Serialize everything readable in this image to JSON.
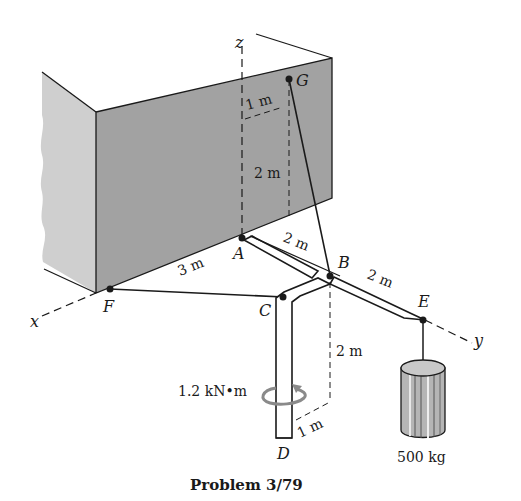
{
  "title": "Problem 3/79",
  "axes": {
    "x": "x",
    "y": "y",
    "z": "z"
  },
  "points": {
    "A": "A",
    "B": "B",
    "C": "C",
    "D": "D",
    "E": "E",
    "F": "F",
    "G": "G"
  },
  "dimensions": {
    "ab": "2 m",
    "be": "2 m",
    "af": "3 m",
    "g_offset": "1 m",
    "g_height": "2 m",
    "b_drop": "2 m",
    "d_offset": "1 m"
  },
  "moment_label": "1.2 kN•m",
  "mass_label": "500 kg",
  "colors": {
    "wall_front": "#9a9a9a",
    "wall_side": "#c8c8c8",
    "line": "#1a1a1a",
    "moment_arrow": "#8a8a8a"
  }
}
